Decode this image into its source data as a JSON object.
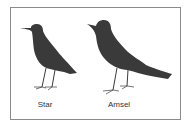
{
  "figure": {
    "birds": [
      {
        "name": "star",
        "label": "Star",
        "icon": "bird-silhouette-icon"
      },
      {
        "name": "amsel",
        "label": "Amsel",
        "icon": "bird-silhouette-icon"
      }
    ],
    "colors": {
      "silhouette": "#3a3a3a",
      "frame": "#8a8a8a",
      "background": "#ffffff"
    }
  }
}
